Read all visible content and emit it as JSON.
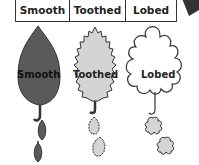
{
  "header": {
    "columns": [
      "Smooth",
      "Toothed",
      "Lobed"
    ]
  },
  "leaves": [
    {
      "label": "Smooth",
      "fill": "#5a5a5a",
      "type": "smooth"
    },
    {
      "label": "Toothed",
      "fill": "#d4d4d4",
      "type": "toothed"
    },
    {
      "label": "Lobed",
      "fill": "#ffffff",
      "type": "lobed"
    }
  ],
  "colors": {
    "outline": "#333333",
    "dark": "#5a5a5a",
    "light": "#d4d4d4"
  }
}
